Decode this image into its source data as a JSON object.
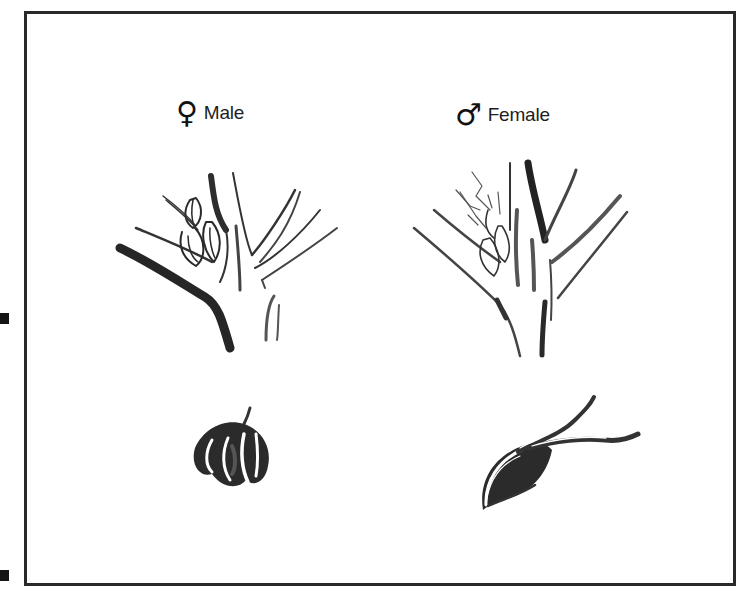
{
  "figure": {
    "panels": [
      {
        "id": "left",
        "symbol": "♀",
        "symbol_name": "venus-symbol",
        "label": "Male"
      },
      {
        "id": "right",
        "symbol": "♂",
        "symbol_name": "mars-symbol",
        "label": "Female"
      }
    ],
    "illustrations": [
      {
        "name": "male-flower-cluster-on-branch",
        "panel": "left"
      },
      {
        "name": "male-single-flower",
        "panel": "left"
      },
      {
        "name": "female-flower-cluster-on-branch",
        "panel": "right"
      },
      {
        "name": "female-single-flower",
        "panel": "right"
      }
    ],
    "colors": {
      "ink": "#1e1e1e",
      "ink_mid": "#555555",
      "frame": "#2a2a2a",
      "background": "#ffffff"
    }
  }
}
